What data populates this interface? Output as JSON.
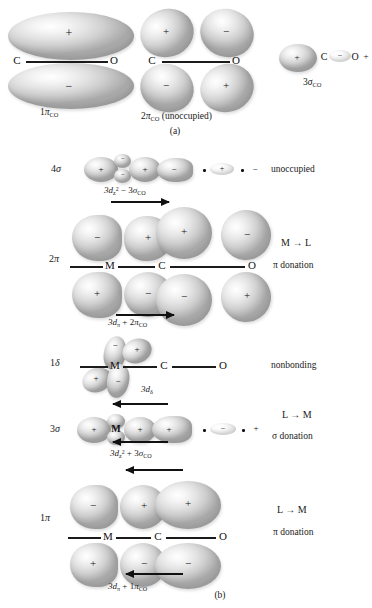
{
  "figure": {
    "panel_a": {
      "caption": "(a)",
      "orbitals": [
        {
          "name": "1pi-CO",
          "label_main": "1",
          "label_greek": "π",
          "label_sub": "CO",
          "atoms": [
            "C",
            "O"
          ],
          "signs_top": [
            "+"
          ],
          "signs_bottom": [
            "−"
          ]
        },
        {
          "name": "2pi-CO",
          "label_main": "2",
          "label_greek": "π",
          "label_sub": "CO",
          "label_suffix": "(unoccupied)",
          "atoms": [
            "C",
            "O"
          ],
          "signs_top": [
            "+",
            "−"
          ],
          "signs_bottom": [
            "−",
            "+"
          ]
        },
        {
          "name": "3sigma-CO",
          "label_main": "3",
          "label_greek": "σ",
          "label_sub": "CO",
          "atoms": [
            "C",
            "O"
          ],
          "signs_inline": [
            "+",
            "−",
            "+"
          ]
        }
      ]
    },
    "panel_b": {
      "caption": "(b)",
      "rows": [
        {
          "name": "4sigma",
          "mo_label_main": "4",
          "mo_label_greek": "σ",
          "combination": {
            "term1_base": "3d",
            "term1_sub": "z",
            "term1_sup": "2",
            "operator": "−",
            "term2_main": "3",
            "term2_greek": "σ",
            "term2_sub": "CO"
          },
          "arrow_direction": "right",
          "signs": [
            "+",
            "−",
            "+",
            "−",
            "+",
            "−"
          ],
          "right_label": "unoccupied",
          "right_label_2": ""
        },
        {
          "name": "2pi",
          "mo_label_main": "2",
          "mo_label_greek": "π",
          "combination": {
            "term1_base": "3d",
            "term1_sub": "π",
            "term1_sup": "",
            "operator": "+",
            "term2_main": "2",
            "term2_greek": "π",
            "term2_sub": "CO"
          },
          "arrow_direction": "right",
          "atoms": [
            "M",
            "C",
            "O"
          ],
          "signs_top": [
            "−",
            "+",
            "+",
            "−"
          ],
          "signs_bottom": [
            "+",
            "−",
            "−",
            "+"
          ],
          "right_label": "M → L",
          "right_label_2": "π donation"
        },
        {
          "name": "1delta",
          "mo_label_main": "1",
          "mo_label_greek": "δ",
          "combination": {
            "term1_base": "3d",
            "term1_sub": "δ",
            "term1_sup": "",
            "operator": "",
            "term2_main": "",
            "term2_greek": "",
            "term2_sub": ""
          },
          "arrow_direction": "",
          "atoms": [
            "M",
            "C",
            "O"
          ],
          "signs_top": [
            "−",
            "+"
          ],
          "signs_bottom": [
            "+",
            "−"
          ],
          "right_label": "nonbonding",
          "right_label_2": ""
        },
        {
          "name": "3sigma",
          "mo_label_main": "3",
          "mo_label_greek": "σ",
          "combination": {
            "term1_base": "3d",
            "term1_sub": "z",
            "term1_sup": "2",
            "operator": "+",
            "term2_main": "3",
            "term2_greek": "σ",
            "term2_sub": "CO"
          },
          "arrow_direction": "left",
          "atoms": [
            "M"
          ],
          "signs": [
            "+",
            "+",
            "+",
            "−",
            "+"
          ],
          "right_label": "L → M",
          "right_label_2": "σ  donation"
        },
        {
          "name": "1pi",
          "mo_label_main": "1",
          "mo_label_greek": "π",
          "combination": {
            "term1_base": "3d",
            "term1_sub": "π",
            "term1_sup": "",
            "operator": "+",
            "term2_main": "1",
            "term2_greek": "π",
            "term2_sub": "CO"
          },
          "arrow_direction": "left",
          "atoms": [
            "M",
            "C",
            "O"
          ],
          "signs_top": [
            "−",
            "+",
            "+"
          ],
          "signs_bottom": [
            "+",
            "−",
            "−"
          ],
          "right_label": "L  →  M",
          "right_label_2": "π donation"
        }
      ]
    }
  }
}
